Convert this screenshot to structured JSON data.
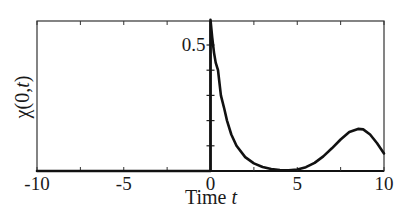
{
  "chart_data": {
    "type": "line",
    "title": "",
    "xlabel": "Time t",
    "xlabel_parts": {
      "text": "Time ",
      "var": "t"
    },
    "ylabel": "χ(0,t)",
    "ylabel_parts": {
      "func": "χ",
      "args": "(0,",
      "var": "t",
      "close": ")"
    },
    "xlim": [
      -10,
      10
    ],
    "ylim": [
      0,
      0.6
    ],
    "x_ticks": [
      -10,
      -7.5,
      -5,
      -2.5,
      0,
      2.5,
      5,
      7.5,
      10
    ],
    "x_tick_labels": [
      {
        "value": -10,
        "label": "-10"
      },
      {
        "value": -5,
        "label": "-5"
      },
      {
        "value": 0,
        "label": "0"
      },
      {
        "value": 5,
        "label": "5"
      },
      {
        "value": 10,
        "label": "10"
      }
    ],
    "y_ticks": [
      0.1,
      0.2,
      0.3,
      0.4,
      0.5
    ],
    "y_tick_labels": [
      {
        "value": 0.5,
        "label": "0.5"
      }
    ],
    "y_axis_position": 0,
    "grid": false,
    "legend": null,
    "series": [
      {
        "name": "χ(0,t)",
        "color": "#111111",
        "x": [
          -10,
          -5,
          -0.001,
          0,
          0.1,
          0.2,
          0.3,
          0.43,
          0.6,
          0.8,
          0.95,
          1.2,
          1.5,
          2.0,
          2.5,
          3.0,
          3.5,
          4.0,
          4.5,
          5.0,
          5.5,
          6.0,
          6.5,
          7.0,
          7.5,
          8.0,
          8.5,
          8.8,
          9.2,
          9.6,
          10.0
        ],
        "y": [
          0,
          0,
          0,
          0.6,
          0.53,
          0.47,
          0.43,
          0.4,
          0.3,
          0.245,
          0.2,
          0.145,
          0.1,
          0.055,
          0.03,
          0.016,
          0.008,
          0.004,
          0.003,
          0.006,
          0.015,
          0.032,
          0.058,
          0.09,
          0.125,
          0.155,
          0.167,
          0.165,
          0.145,
          0.11,
          0.07
        ]
      }
    ]
  },
  "layout": {
    "plot_box": {
      "left": 37,
      "top": 21,
      "right": 384,
      "bottom": 171
    },
    "y_zero_px": 171,
    "y_per_unit_px": 252
  }
}
